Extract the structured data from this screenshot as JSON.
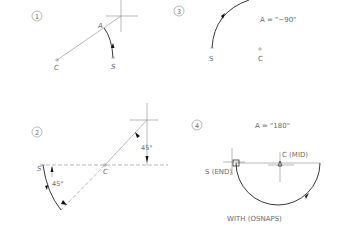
{
  "figure": {
    "panels": [
      {
        "id": "1",
        "labels": {
          "number": "1",
          "angle_point": "A",
          "center": "C",
          "start": "S"
        }
      },
      {
        "id": "2",
        "labels": {
          "number": "2",
          "start": "S",
          "center": "C",
          "angle_top": "45°",
          "angle_bottom": "45°"
        }
      },
      {
        "id": "3",
        "labels": {
          "number": "3",
          "equation": "A = \"−90\"",
          "start": "S",
          "center": "C"
        }
      },
      {
        "id": "4",
        "labels": {
          "number": "4",
          "equation": "A = \"180\"",
          "center": "C (MID)",
          "start": "S (END)",
          "caption": "WITH (OSNAPS)"
        }
      }
    ]
  }
}
